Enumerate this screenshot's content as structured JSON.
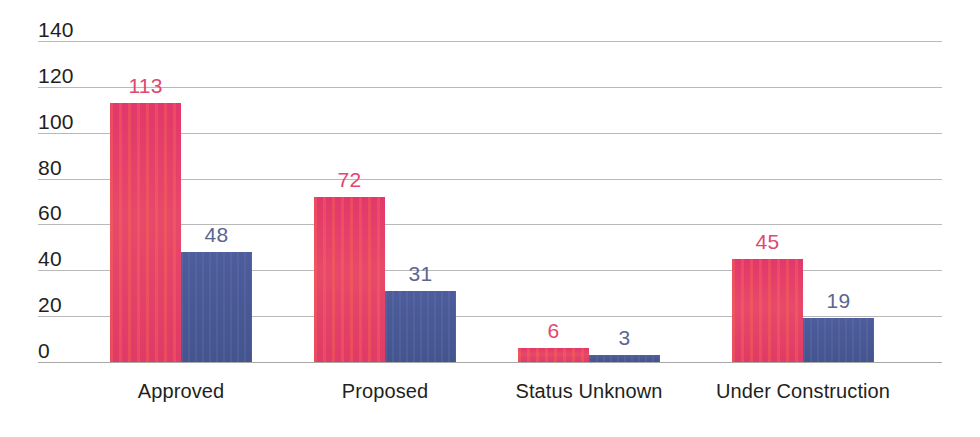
{
  "chart_data": {
    "type": "bar",
    "title": "",
    "subtitle": "",
    "xlabel": "",
    "ylabel": "",
    "ylim": [
      0,
      140
    ],
    "yticks": [
      0,
      20,
      40,
      60,
      80,
      100,
      120,
      140
    ],
    "ytick_labels": [
      "0",
      "20",
      "40",
      "60",
      "80",
      "100",
      "120",
      "140"
    ],
    "grid": true,
    "grid_axis": "y",
    "legend": false,
    "legend_position": "none",
    "orientation": "vertical",
    "grouping": "grouped",
    "categories": [
      "Approved",
      "Proposed",
      "Status Unknown",
      "Under Construction"
    ],
    "series": [
      {
        "name": "series-a",
        "color": "#e0366a",
        "label_color": "#e0486f",
        "values": [
          113,
          72,
          6,
          45
        ],
        "value_labels": [
          "113",
          "72",
          "6",
          "45"
        ]
      },
      {
        "name": "series-b",
        "color": "#4a5a9a",
        "label_color": "#5b6592",
        "values": [
          48,
          31,
          3,
          19
        ],
        "value_labels": [
          "48",
          "31",
          "3",
          "19"
        ]
      }
    ],
    "data_labels_shown": true,
    "background_color": "#ffffff",
    "gridline_color": "#b9b9b9",
    "axis_text_color": "#231f20"
  }
}
